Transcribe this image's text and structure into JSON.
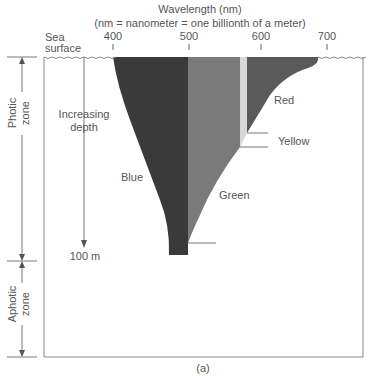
{
  "title": "Wavelength (nm)",
  "subtitle": "(nm = nanometer = one billionth of a meter)",
  "sea_surface_label": [
    "Sea",
    "surface"
  ],
  "wavelength_ticks": [
    {
      "label": "400",
      "x": 113
    },
    {
      "label": "500",
      "x": 189
    },
    {
      "label": "600",
      "x": 261
    },
    {
      "label": "700",
      "x": 327
    }
  ],
  "depth_label": [
    "Increasing",
    "depth"
  ],
  "depth_marker": "100 m",
  "zones": {
    "photic": [
      "Photic",
      "zone"
    ],
    "aphotic": [
      "Aphotic",
      "zone"
    ]
  },
  "bands": [
    {
      "name": "Blue",
      "color": "#3a3a3a"
    },
    {
      "name": "Green",
      "color": "#7a7a7a"
    },
    {
      "name": "Yellow",
      "color": "#d4d4d4"
    },
    {
      "name": "Red",
      "color": "#5a5a5a"
    }
  ],
  "caption": "(a)"
}
